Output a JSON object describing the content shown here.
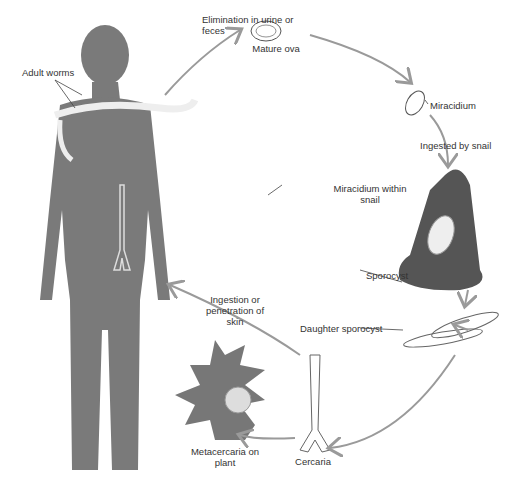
{
  "diagram": {
    "colors": {
      "silhouette": "#7a7a7a",
      "snail": "#555555",
      "arrow": "#9a9a9a",
      "text": "#333333"
    },
    "labels": {
      "elimination": "Elimination in urine or feces",
      "mature_ova": "Mature ova",
      "miracidium": "Miracidium",
      "ingested": "Ingested by snail",
      "miracidium_snail": "Miracidium within snail",
      "sporocyst": "Sporocyst",
      "daughter_sporocyst": "Daughter sporocyst",
      "ingestion": "Ingestion or penetration of skin",
      "cercaria": "Cercaria",
      "metacercaria": "Metacercaria on plant",
      "adult_worms": "Adult worms"
    }
  }
}
